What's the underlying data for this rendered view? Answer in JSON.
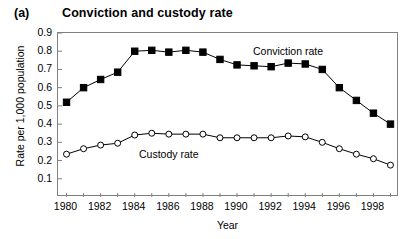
{
  "figure": {
    "panel_label": "(a)",
    "title": "Conviction and custody rate"
  },
  "chart_data": {
    "type": "line",
    "title": "Conviction and custody rate",
    "xlabel": "Year",
    "ylabel": "Rate per 1,000 population",
    "xlim": [
      1979.5,
      1999.5
    ],
    "ylim": [
      0.0,
      0.9
    ],
    "grid": false,
    "legend_position": "inline-annotations",
    "x": [
      1980,
      1981,
      1982,
      1983,
      1984,
      1985,
      1986,
      1987,
      1988,
      1989,
      1990,
      1991,
      1992,
      1993,
      1994,
      1995,
      1996,
      1997,
      1998,
      1999
    ],
    "ytick_labels": [
      "0.1",
      "0.2",
      "0.3",
      "0.4",
      "0.5",
      "0.6",
      "0.7",
      "0.8",
      "0.9"
    ],
    "ytick_values": [
      0.1,
      0.2,
      0.3,
      0.4,
      0.5,
      0.6,
      0.7,
      0.8,
      0.9
    ],
    "xtick_labels": [
      "1980",
      "1982",
      "1984",
      "1986",
      "1988",
      "1990",
      "1992",
      "1994",
      "1996",
      "1998"
    ],
    "xtick_values": [
      1980,
      1982,
      1984,
      1986,
      1988,
      1990,
      1992,
      1994,
      1996,
      1998
    ],
    "series": [
      {
        "name": "Conviction rate",
        "marker": "filled-square",
        "color": "#000000",
        "annotation": "Conviction rate",
        "values": [
          0.52,
          0.6,
          0.645,
          0.685,
          0.8,
          0.805,
          0.795,
          0.805,
          0.795,
          0.755,
          0.725,
          0.72,
          0.715,
          0.735,
          0.73,
          0.7,
          0.6,
          0.53,
          0.46,
          0.4
        ]
      },
      {
        "name": "Custody rate",
        "marker": "open-circle",
        "color": "#000000",
        "annotation": "Custody rate",
        "values": [
          0.235,
          0.265,
          0.285,
          0.295,
          0.34,
          0.35,
          0.345,
          0.345,
          0.345,
          0.325,
          0.325,
          0.325,
          0.325,
          0.335,
          0.33,
          0.3,
          0.265,
          0.235,
          0.21,
          0.175
        ]
      }
    ]
  }
}
